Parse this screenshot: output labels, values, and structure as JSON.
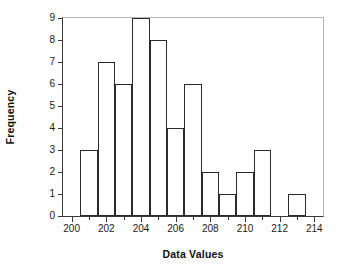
{
  "chart_data": {
    "type": "bar",
    "title": "",
    "subtitle": "",
    "xlabel": "Data Values",
    "ylabel": "Frequency",
    "xlim": [
      199.5,
      214.5
    ],
    "ylim": [
      0,
      9
    ],
    "grid": false,
    "legend": null,
    "bin_width": 1,
    "x_ticks_major": [
      200,
      202,
      204,
      206,
      208,
      210,
      212,
      214
    ],
    "x_ticks_minor": [
      201,
      203,
      205,
      207,
      209,
      211,
      213
    ],
    "x_tick_labels": [
      "200",
      "202",
      "204",
      "206",
      "208",
      "210",
      "212",
      "214"
    ],
    "y_ticks": [
      0,
      1,
      2,
      3,
      4,
      5,
      6,
      7,
      8,
      9
    ],
    "y_tick_labels": [
      "0",
      "1",
      "2",
      "3",
      "4",
      "5",
      "6",
      "7",
      "8",
      "9"
    ],
    "bins": [
      {
        "left": 200.5,
        "right": 201.5,
        "value": 3
      },
      {
        "left": 201.5,
        "right": 202.5,
        "value": 7
      },
      {
        "left": 202.5,
        "right": 203.5,
        "value": 6
      },
      {
        "left": 203.5,
        "right": 204.5,
        "value": 9
      },
      {
        "left": 204.5,
        "right": 205.5,
        "value": 8
      },
      {
        "left": 205.5,
        "right": 206.5,
        "value": 4
      },
      {
        "left": 206.5,
        "right": 207.5,
        "value": 6
      },
      {
        "left": 207.5,
        "right": 208.5,
        "value": 2
      },
      {
        "left": 208.5,
        "right": 209.5,
        "value": 1
      },
      {
        "left": 209.5,
        "right": 210.5,
        "value": 2
      },
      {
        "left": 210.5,
        "right": 211.5,
        "value": 3
      },
      {
        "left": 212.5,
        "right": 213.5,
        "value": 1
      }
    ],
    "categories": [
      "200.5-201.5",
      "201.5-202.5",
      "202.5-203.5",
      "203.5-204.5",
      "204.5-205.5",
      "205.5-206.5",
      "206.5-207.5",
      "207.5-208.5",
      "208.5-209.5",
      "209.5-210.5",
      "210.5-211.5",
      "212.5-213.5"
    ],
    "values": [
      3,
      7,
      6,
      9,
      8,
      4,
      6,
      2,
      1,
      2,
      3,
      1
    ]
  },
  "style": {
    "bar_fill": "#ffffff",
    "bar_stroke": "#2b2b2b",
    "axis_color": "#3a3a3a",
    "frame_color": "#b8b8b8",
    "text_color": "#1a1a1a",
    "background": "#ffffff"
  }
}
